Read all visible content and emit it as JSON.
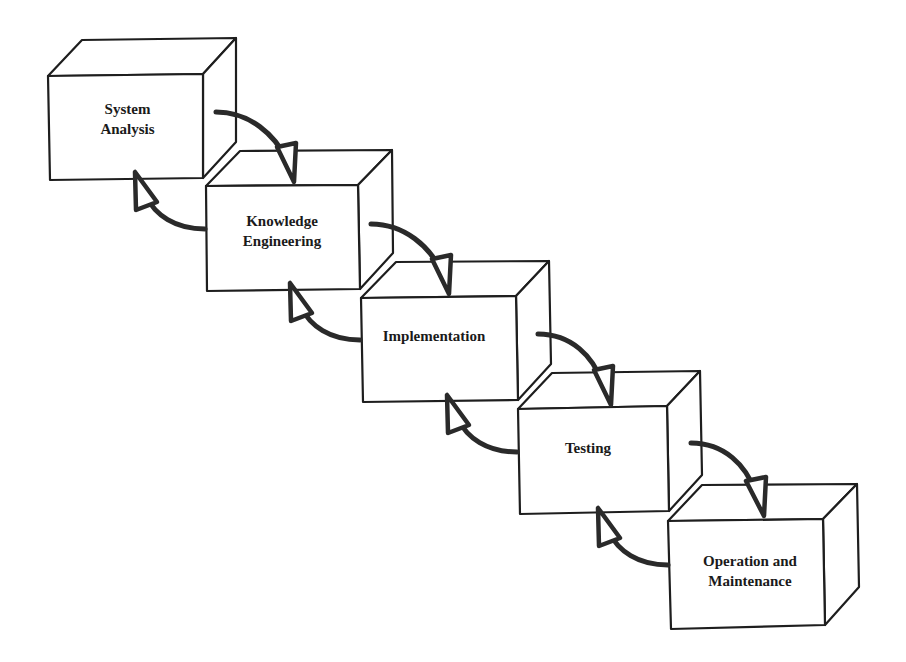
{
  "diagram": {
    "type": "waterfall-lifecycle",
    "stages": [
      {
        "id": 1,
        "line1": "System",
        "line2": "Analysis"
      },
      {
        "id": 2,
        "line1": "Knowledge",
        "line2": "Engineering"
      },
      {
        "id": 3,
        "line1": "Implementation",
        "line2": ""
      },
      {
        "id": 4,
        "line1": "Testing",
        "line2": ""
      },
      {
        "id": 5,
        "line1": "Operation and",
        "line2": "Maintenance"
      }
    ],
    "connections": [
      {
        "from": 1,
        "to": 2,
        "direction": "forward"
      },
      {
        "from": 2,
        "to": 1,
        "direction": "backward"
      },
      {
        "from": 2,
        "to": 3,
        "direction": "forward"
      },
      {
        "from": 3,
        "to": 2,
        "direction": "backward"
      },
      {
        "from": 3,
        "to": 4,
        "direction": "forward"
      },
      {
        "from": 4,
        "to": 3,
        "direction": "backward"
      },
      {
        "from": 4,
        "to": 5,
        "direction": "forward"
      },
      {
        "from": 5,
        "to": 4,
        "direction": "backward"
      }
    ],
    "colors": {
      "line": "#1e1e1e",
      "background": "#ffffff"
    }
  }
}
